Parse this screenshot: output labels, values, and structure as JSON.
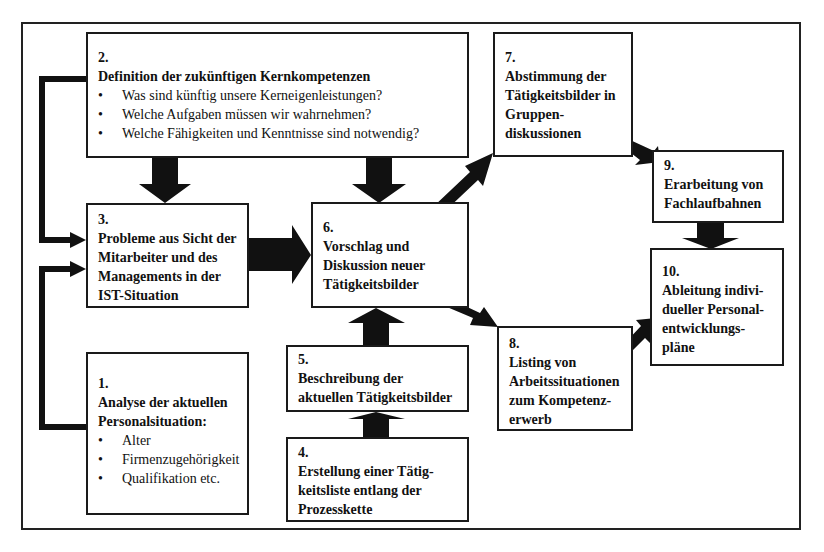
{
  "diagram": {
    "boxes": {
      "b1": {
        "num": "1.",
        "title": "Analyse der aktuellen Personalsituation:",
        "bullets": [
          "Alter",
          "Firmenzugehörigkeit",
          "Qualifikation etc."
        ]
      },
      "b2": {
        "num": "2.",
        "title": "Definition der zukünftigen Kernkompetenzen",
        "bullets": [
          "Was sind künftig unsere Kerneigenleistungen?",
          "Welche Aufgaben müssen wir wahrnehmen?",
          "Welche Fähigkeiten und Kenntnisse sind notwendig?"
        ]
      },
      "b3": {
        "num": "3.",
        "title": "Probleme aus Sicht der Mitarbeiter und des Managements in der IST-Situation"
      },
      "b4": {
        "num": "4.",
        "title": "Erstellung einer Tätig-keitsliste entlang der Prozesskette"
      },
      "b5": {
        "num": "5.",
        "title": "Beschreibung der aktuellen Tätigkeitsbilder"
      },
      "b6": {
        "num": "6.",
        "title": "Vorschlag und Diskussion neuer Tätigkeitsbilder"
      },
      "b7": {
        "num": "7.",
        "title": "Abstimmung der Tätigkeitsbilder in Gruppen-diskussionen"
      },
      "b8": {
        "num": "8.",
        "title": "Listing von Arbeitssituationen zum Kompetenz-erwerb"
      },
      "b9": {
        "num": "9.",
        "title": "Erarbeitung von Fachlaufbahnen"
      },
      "b10": {
        "num": "10.",
        "title": "Ableitung indivi-dueller Personal-entwicklungs-pläne"
      }
    },
    "edges": [
      {
        "from": "2",
        "to": "3"
      },
      {
        "from": "2",
        "to": "6"
      },
      {
        "from": "1",
        "to": "3"
      },
      {
        "from": "3",
        "to": "6"
      },
      {
        "from": "4",
        "to": "5"
      },
      {
        "from": "5",
        "to": "6"
      },
      {
        "from": "6",
        "to": "7"
      },
      {
        "from": "6",
        "to": "8"
      },
      {
        "from": "7",
        "to": "9"
      },
      {
        "from": "9",
        "to": "10"
      },
      {
        "from": "8",
        "to": "10"
      }
    ],
    "colors": {
      "ink": "#111111",
      "background": "#ffffff"
    }
  }
}
